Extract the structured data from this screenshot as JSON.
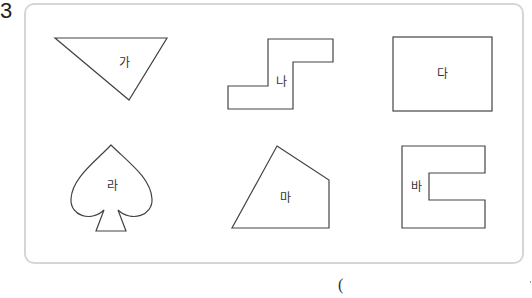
{
  "question": {
    "number": "3"
  },
  "shapes": [
    {
      "id": "ga",
      "label": "가",
      "kind": "triangle"
    },
    {
      "id": "na",
      "label": "나",
      "kind": "z-polygon"
    },
    {
      "id": "da",
      "label": "다",
      "kind": "rectangle"
    },
    {
      "id": "ra",
      "label": "라",
      "kind": "spade"
    },
    {
      "id": "ma",
      "label": "마",
      "kind": "quadrilateral"
    },
    {
      "id": "ba",
      "label": "바",
      "kind": "c-polygon"
    }
  ],
  "answer": {
    "open_paren": "("
  },
  "colors": {
    "stroke": "#444444",
    "panel_border": "#d6d6d6"
  }
}
